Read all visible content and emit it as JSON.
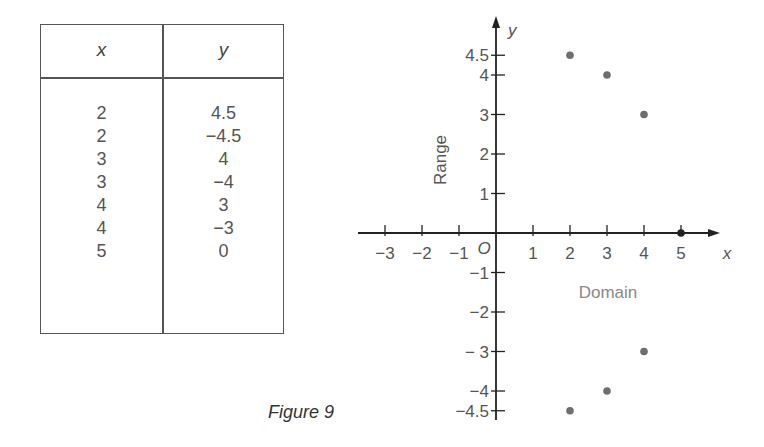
{
  "table": {
    "headers": {
      "x": "x",
      "y": "y"
    },
    "rows": [
      {
        "x": "2",
        "y": "4.5"
      },
      {
        "x": "2",
        "y": "−4.5"
      },
      {
        "x": "3",
        "y": "4"
      },
      {
        "x": "3",
        "y": "−4"
      },
      {
        "x": "4",
        "y": "3"
      },
      {
        "x": "4",
        "y": "−3"
      },
      {
        "x": "5",
        "y": "0"
      }
    ]
  },
  "caption": "Figure 9",
  "chart_data": {
    "type": "scatter",
    "title": "",
    "xlabel": "x",
    "ylabel": "y",
    "x_axis_annotation": "Domain",
    "y_axis_annotation": "Range",
    "origin_label": "O",
    "xlim": [
      -3.5,
      6
    ],
    "ylim": [
      -4.9,
      5.3
    ],
    "grid": false,
    "x_ticks": [
      {
        "value": -3,
        "label": "−3"
      },
      {
        "value": -2,
        "label": "−2"
      },
      {
        "value": -1,
        "label": "−1"
      },
      {
        "value": 1,
        "label": "1"
      },
      {
        "value": 2,
        "label": "2"
      },
      {
        "value": 3,
        "label": "3"
      },
      {
        "value": 4,
        "label": "4"
      },
      {
        "value": 5,
        "label": "5"
      }
    ],
    "y_ticks": [
      {
        "value": 4.5,
        "label": "4.5"
      },
      {
        "value": 4,
        "label": "4"
      },
      {
        "value": 3,
        "label": "3"
      },
      {
        "value": 2,
        "label": "2"
      },
      {
        "value": 1,
        "label": "1"
      },
      {
        "value": -1,
        "label": "−1"
      },
      {
        "value": -2,
        "label": "−2"
      },
      {
        "value": -3,
        "label": "− 3"
      },
      {
        "value": -4,
        "label": "−4"
      },
      {
        "value": -4.5,
        "label": "−4.5"
      }
    ],
    "points": [
      {
        "x": 2,
        "y": 4.5
      },
      {
        "x": 2,
        "y": -4.5
      },
      {
        "x": 3,
        "y": 4
      },
      {
        "x": 3,
        "y": -4
      },
      {
        "x": 4,
        "y": 3
      },
      {
        "x": 4,
        "y": -3
      },
      {
        "x": 5,
        "y": 0
      }
    ],
    "colors": {
      "axis": "#222222",
      "point": "#6e6e6e",
      "label": "#555555",
      "annotation": "#888888"
    }
  }
}
